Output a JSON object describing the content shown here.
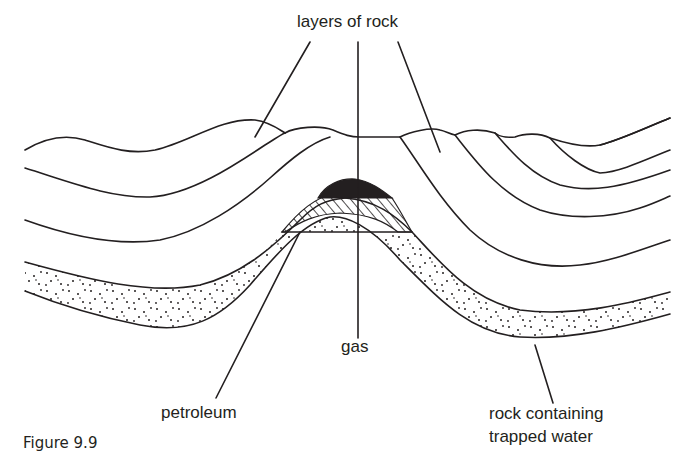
{
  "figure": {
    "caption": "Figure 9.9",
    "type": "geological cross-section (anticline trap)"
  },
  "labels": {
    "layers_of_rock": "layers of rock",
    "gas": "gas",
    "petroleum": "petroleum",
    "water_rock_line1": "rock containing",
    "water_rock_line2": "trapped water"
  },
  "legend_fills": {
    "gas": "solid black",
    "petroleum": "diagonal hatching",
    "trapped_water": "stippled dots"
  },
  "colors": {
    "ink": "#231f20",
    "background": "#ffffff"
  }
}
